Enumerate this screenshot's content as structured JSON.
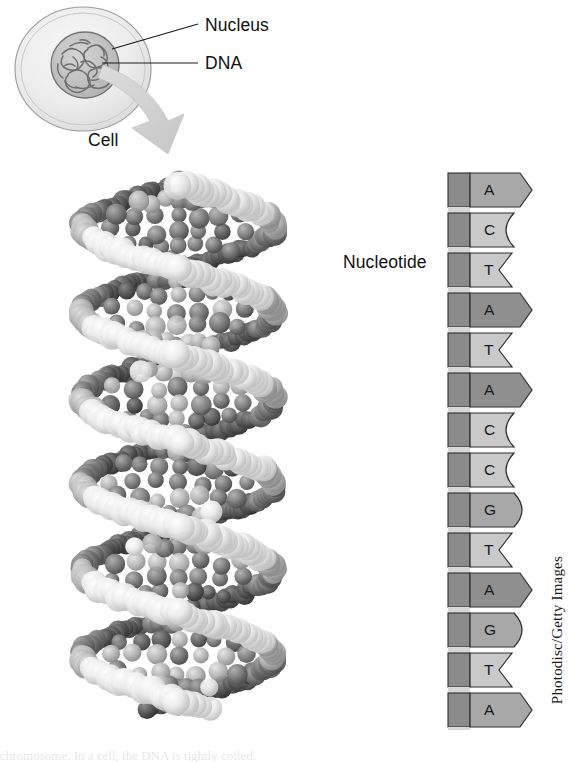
{
  "figure": {
    "credit": "Photodisc/Getty Images",
    "bottom_bleed_text": "chromosome. In a cell, the DNA is tightly coiled."
  },
  "cell_diagram": {
    "nucleus_label": "Nucleus",
    "dna_label": "DNA",
    "cell_label": "Cell",
    "arrow_name": "magnify-arrow"
  },
  "helix": {
    "alt": "DNA double helix space-filling model"
  },
  "nucleotide_panel": {
    "bracket_label": "Nucleotide",
    "bases": [
      {
        "letter": "A",
        "shape": "point",
        "tone": "mid"
      },
      {
        "letter": "C",
        "shape": "round-notch",
        "tone": "light"
      },
      {
        "letter": "T",
        "shape": "v-notch",
        "tone": "light"
      },
      {
        "letter": "A",
        "shape": "point",
        "tone": "dark"
      },
      {
        "letter": "T",
        "shape": "v-notch",
        "tone": "light"
      },
      {
        "letter": "A",
        "shape": "point",
        "tone": "dark"
      },
      {
        "letter": "C",
        "shape": "round-notch",
        "tone": "light"
      },
      {
        "letter": "C",
        "shape": "round-notch",
        "tone": "light"
      },
      {
        "letter": "G",
        "shape": "round-point",
        "tone": "mid"
      },
      {
        "letter": "T",
        "shape": "v-notch",
        "tone": "light"
      },
      {
        "letter": "A",
        "shape": "point",
        "tone": "dark"
      },
      {
        "letter": "G",
        "shape": "round-point",
        "tone": "mid"
      },
      {
        "letter": "T",
        "shape": "v-notch",
        "tone": "light"
      },
      {
        "letter": "A",
        "shape": "point",
        "tone": "mid"
      }
    ],
    "sequence": "A C T A T A C C G T A G T A"
  },
  "colors": {
    "base_light": "#c9c9c9",
    "base_mid": "#a8a8a8",
    "base_dark": "#8f8f8f",
    "backbone_dark": "#8b8b8b",
    "backbone_light": "#d8d8d8",
    "outline": "#2e2e2e",
    "arrow_gray": "#cfcfcf",
    "cell_fill": "#ececec",
    "nucleus_fill": "#c4c4c4",
    "text": "#1a1a1a"
  }
}
